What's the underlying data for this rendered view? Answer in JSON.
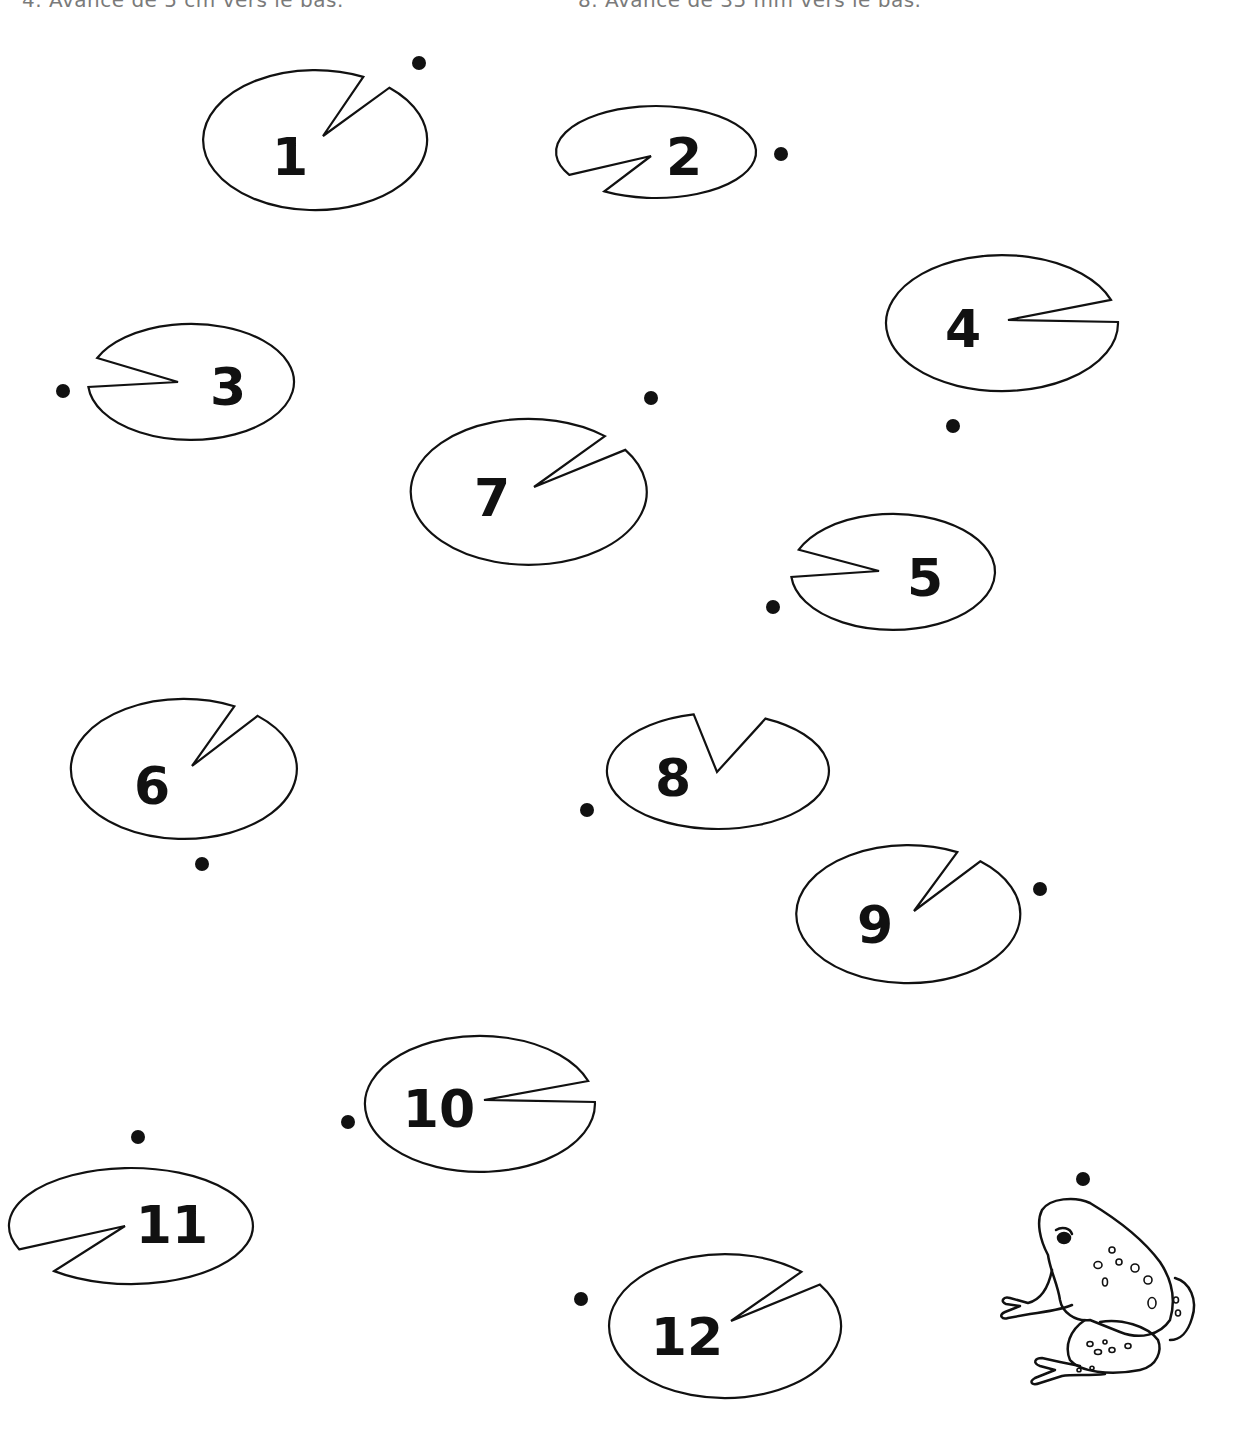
{
  "instructions": [
    {
      "text": "4. Avance de 5 cm vers le bas.",
      "x": 22
    },
    {
      "text": "8. Avance de 35 mm vers le bas.",
      "x": 578
    }
  ],
  "colors": {
    "ink": "#111111",
    "paper": "#ffffff",
    "faint_text": "#7a7a7a"
  },
  "lily_pads": [
    {
      "number": "1",
      "cx": 315,
      "cy": 140,
      "rx": 112,
      "ry": 70,
      "wedge": [
        [
          364,
          76
        ],
        [
          323,
          136
        ],
        [
          389,
          88
        ]
      ],
      "label_x": 290,
      "label_y": 175,
      "dot": [
        419,
        63
      ]
    },
    {
      "number": "2",
      "cx": 656,
      "cy": 152,
      "rx": 100,
      "ry": 46,
      "wedge": [
        [
          569,
          175
        ],
        [
          651,
          156
        ],
        [
          601,
          194
        ]
      ],
      "label_x": 684,
      "label_y": 175,
      "dot": [
        781,
        154
      ]
    },
    {
      "number": "3",
      "cx": 191,
      "cy": 382,
      "rx": 103,
      "ry": 58,
      "wedge": [
        [
          97,
          358
        ],
        [
          178,
          382
        ],
        [
          89,
          387
        ]
      ],
      "label_x": 228,
      "label_y": 405,
      "dot": [
        63,
        391
      ]
    },
    {
      "number": "4",
      "cx": 1002,
      "cy": 323,
      "rx": 116,
      "ry": 68,
      "wedge": [
        [
          1110,
          300
        ],
        [
          1008,
          320
        ],
        [
          1117,
          322
        ]
      ],
      "label_x": 963,
      "label_y": 347,
      "dot": [
        953,
        426
      ]
    },
    {
      "number": "5",
      "cx": 893,
      "cy": 572,
      "rx": 102,
      "ry": 58,
      "wedge": [
        [
          800,
          550
        ],
        [
          879,
          571
        ],
        [
          792,
          577
        ]
      ],
      "label_x": 925,
      "label_y": 596,
      "dot": [
        773,
        607
      ]
    },
    {
      "number": "6",
      "cx": 184,
      "cy": 769,
      "rx": 113,
      "ry": 70,
      "wedge": [
        [
          233,
          708
        ],
        [
          192,
          766
        ],
        [
          256,
          717
        ]
      ],
      "label_x": 152,
      "label_y": 804,
      "dot": [
        202,
        864
      ]
    },
    {
      "number": "7",
      "cx": 529,
      "cy": 492,
      "rx": 118,
      "ry": 73,
      "wedge": [
        [
          605,
          436
        ],
        [
          534,
          487
        ],
        [
          625,
          450
        ]
      ],
      "label_x": 492,
      "label_y": 516,
      "dot": [
        651,
        398
      ]
    },
    {
      "number": "8",
      "cx": 718,
      "cy": 771,
      "rx": 111,
      "ry": 58,
      "wedge": [
        [
          694,
          715
        ],
        [
          717,
          772
        ],
        [
          766,
          718
        ]
      ],
      "label_x": 673,
      "label_y": 796,
      "dot": [
        587,
        810
      ]
    },
    {
      "number": "9",
      "cx": 908,
      "cy": 914,
      "rx": 112,
      "ry": 69,
      "wedge": [
        [
          955,
          855
        ],
        [
          914,
          911
        ],
        [
          978,
          863
        ]
      ],
      "label_x": 875,
      "label_y": 943,
      "dot": [
        1040,
        889
      ]
    },
    {
      "number": "10",
      "cx": 480,
      "cy": 1104,
      "rx": 115,
      "ry": 68,
      "wedge": [
        [
          588,
          1081
        ],
        [
          484,
          1100
        ],
        [
          593,
          1102
        ]
      ],
      "label_x": 439,
      "label_y": 1127,
      "dot": [
        348,
        1122
      ]
    },
    {
      "number": "11",
      "cx": 131,
      "cy": 1226,
      "rx": 122,
      "ry": 58,
      "wedge": [
        [
          21,
          1249
        ],
        [
          125,
          1226
        ],
        [
          56,
          1270
        ]
      ],
      "label_x": 172,
      "label_y": 1243,
      "dot": [
        138,
        1137
      ]
    },
    {
      "number": "12",
      "cx": 725,
      "cy": 1326,
      "rx": 116,
      "ry": 72,
      "wedge": [
        [
          801,
          1272
        ],
        [
          731,
          1321
        ],
        [
          819,
          1285
        ]
      ],
      "label_x": 687,
      "label_y": 1355,
      "dot": [
        581,
        1299
      ]
    }
  ],
  "frog": {
    "icon": "frog-icon",
    "x": 995,
    "y": 1195,
    "dot": [
      1083,
      1179
    ]
  }
}
